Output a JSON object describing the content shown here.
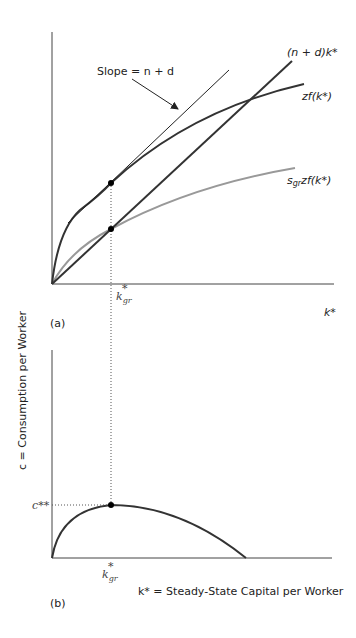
{
  "panel_a": {
    "label": "(a)",
    "x_axis_label": "k*",
    "slope_label": "Slope = n + d",
    "line_label": "(n + d)k*",
    "output_label": "zf(k*)",
    "savings_label_s": "s",
    "savings_label_sub": "gr",
    "savings_label_rest": "zf(k*)",
    "kgr_label": "k",
    "kgr_sub": "gr",
    "kgr_sup": "*"
  },
  "panel_b": {
    "label": "(b)",
    "y_axis_label": "c = Consumption per Worker",
    "x_axis_label": "k* = Steady-State Capital per Worker",
    "c_label": "c**",
    "kgr_label": "k",
    "kgr_sub": "gr",
    "kgr_sup": "*"
  },
  "colors": {
    "dark": "#333333",
    "light": "#999999"
  }
}
